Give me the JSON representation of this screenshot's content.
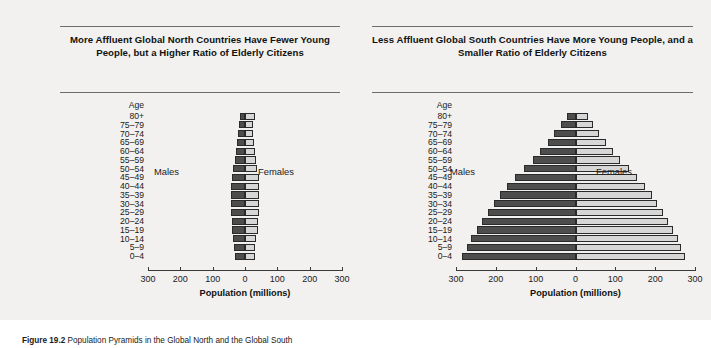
{
  "figure": {
    "background_color": "#f2f1ef",
    "male_color": "#4d4d4d",
    "female_color": "#d6d6d6",
    "caption_number": "Figure 19.2",
    "caption_text": "Population Pyramids in the Global North and the Global South"
  },
  "axis": {
    "title": "Population (millions)",
    "age_header": "Age",
    "tick_labels": [
      "300",
      "200",
      "100",
      "0",
      "100",
      "200",
      "300"
    ],
    "tick_values": [
      -300,
      -200,
      -100,
      0,
      100,
      200,
      300
    ],
    "male_series_label": "Males",
    "female_series_label": "Females"
  },
  "age_groups": [
    "80+",
    "75–79",
    "70–74",
    "65–69",
    "60–64",
    "55–59",
    "50–54",
    "45–49",
    "40–44",
    "35–39",
    "30–34",
    "25–29",
    "20–24",
    "15–19",
    "10–14",
    "5–9",
    "0–4"
  ],
  "chart_data": [
    {
      "type": "bar",
      "id": "global-north",
      "title": "More Affluent Global North Countries Have Fewer Young People, but a Higher Ratio of Elderly Citizens",
      "orientation": "horizontal",
      "layout": "population-pyramid",
      "xlabel": "Population (millions)",
      "ylabel": "Age",
      "xlim": [
        -300,
        300
      ],
      "xticks": [
        -300,
        -200,
        -100,
        0,
        100,
        200,
        300
      ],
      "grid": false,
      "legend_position": "inline",
      "categories": [
        "80+",
        "75–79",
        "70–74",
        "65–69",
        "60–64",
        "55–59",
        "50–54",
        "45–49",
        "40–44",
        "35–39",
        "30–34",
        "25–29",
        "20–24",
        "15–19",
        "10–14",
        "5–9",
        "0–4"
      ],
      "series": [
        {
          "name": "Males",
          "values": [
            16,
            18,
            21,
            24,
            28,
            31,
            37,
            41,
            44,
            44,
            43,
            42,
            41,
            40,
            36,
            33,
            32
          ]
        },
        {
          "name": "Females",
          "values": [
            30,
            26,
            26,
            27,
            30,
            33,
            38,
            42,
            44,
            44,
            43,
            42,
            41,
            39,
            35,
            32,
            31
          ]
        }
      ]
    },
    {
      "type": "bar",
      "id": "global-south",
      "title": "Less Affluent Global South Countries Have More Young People, and a Smaller Ratio of Elderly Citizens",
      "orientation": "horizontal",
      "layout": "population-pyramid",
      "xlabel": "Population (millions)",
      "ylabel": "Age",
      "xlim": [
        -300,
        300
      ],
      "xticks": [
        -300,
        -200,
        -100,
        0,
        100,
        200,
        300
      ],
      "grid": false,
      "legend_position": "inline",
      "categories": [
        "80+",
        "75–79",
        "70–74",
        "65–69",
        "60–64",
        "55–59",
        "50–54",
        "45–49",
        "40–44",
        "35–39",
        "30–34",
        "25–29",
        "20–24",
        "15–19",
        "10–14",
        "5–9",
        "0–4"
      ],
      "series": [
        {
          "name": "Males",
          "values": [
            22,
            36,
            53,
            70,
            88,
            107,
            130,
            152,
            172,
            190,
            205,
            220,
            235,
            248,
            262,
            272,
            285
          ]
        },
        {
          "name": "Females",
          "values": [
            32,
            44,
            60,
            76,
            94,
            112,
            134,
            155,
            174,
            191,
            205,
            219,
            233,
            245,
            257,
            265,
            275
          ]
        }
      ]
    }
  ]
}
